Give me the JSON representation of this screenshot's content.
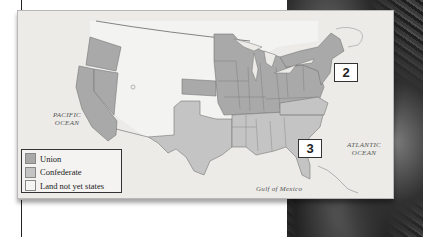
{
  "map": {
    "ocean_labels": {
      "pacific": "PACIFIC\nOCEAN",
      "pacific_line1": "PACIFIC",
      "pacific_line2": "OCEAN",
      "atlantic_line1": "ATLANTIC",
      "atlantic_line2": "OCEAN",
      "gulf": "Gulf of Mexico"
    },
    "callouts": [
      {
        "label": "2"
      },
      {
        "label": "3"
      }
    ],
    "colors": {
      "union": "#a9a9a9",
      "confederate": "#c4c4c4",
      "territory": "#f2f2f0",
      "ocean": "#ecebe8"
    }
  },
  "legend": {
    "items": [
      {
        "label": "Union",
        "color": "#a9a9a9"
      },
      {
        "label": "Confederate",
        "color": "#c4c4c4"
      },
      {
        "label": "Land not yet states",
        "color": "#f5f5f3"
      }
    ]
  }
}
